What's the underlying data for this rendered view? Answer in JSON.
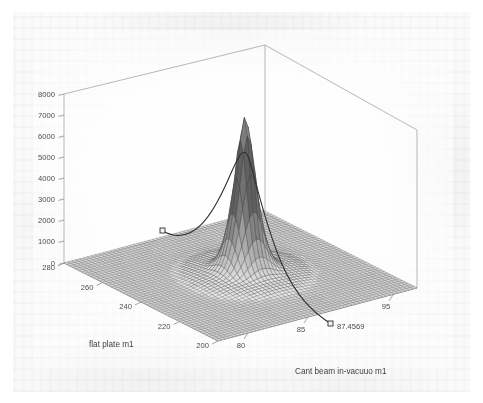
{
  "figure": {
    "kind": "matlab-3d-surface-plot",
    "background_color": "#fafafa",
    "page_color": "#ffffff",
    "mesh_color": "#4a4a4a",
    "curve_color": "#2b2b2b",
    "axis_color": "#6b6b6b",
    "marker_annotation": "87.4569"
  },
  "chart_data": {
    "type": "surface",
    "title": "",
    "subtitle": "",
    "xlabel": "flat plate m1",
    "ylabel": "Cant beam in-vacuuo m1",
    "zlabel": "",
    "xticks": [
      280,
      260,
      240,
      220,
      200
    ],
    "yticks": [
      80,
      85,
      95
    ],
    "zticks": [
      0,
      1000,
      2000,
      3000,
      4000,
      5000,
      6000,
      7000,
      8000
    ],
    "xlim": [
      195,
      285
    ],
    "ylim": [
      77,
      97
    ],
    "zlim": [
      0,
      8000
    ],
    "grid": true,
    "legend": null,
    "view": "3d azimuth approx -37.5 elevation approx 30",
    "surface": {
      "description": "single tall narrow gaussian-like resonance peak on a flat near-zero plate",
      "peak_value": 7200,
      "peak_x": 240,
      "peak_y": 87.4569,
      "baseline_value": 0,
      "mesh_rows": 52,
      "mesh_cols": 52
    },
    "annotations": [
      {
        "label": "87.4569",
        "x": 87.4569,
        "axis": "Cant beam in-vacuuo m1",
        "marker": "square",
        "note": "cross-section cut line across the surface, square end markers"
      }
    ]
  },
  "axes": {
    "z": {
      "ticks": [
        "8000",
        "7000",
        "6000",
        "5000",
        "4000",
        "3000",
        "2000",
        "1000",
        "0"
      ]
    },
    "x": {
      "label": "flat plate m1",
      "ticks": [
        "280",
        "260",
        "240",
        "220",
        "200"
      ]
    },
    "y": {
      "label": "Cant beam in-vacuuo m1",
      "ticks": [
        "80",
        "85",
        "95"
      ],
      "annotation": "87.4569"
    }
  }
}
